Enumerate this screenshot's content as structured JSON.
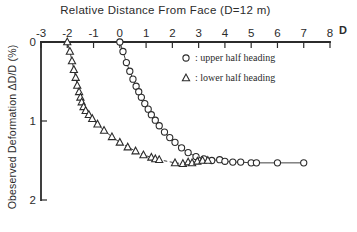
{
  "chart_data": {
    "type": "scatter",
    "title": "Relative Distance From Face (D=12 m)",
    "xlabel": "Relative Distance From Face (D=12 m)",
    "ylabel": "Obeserved Deformation ΔD/D (%)",
    "x_unit_label": "D",
    "xlim": [
      -3,
      8
    ],
    "ylim": [
      0,
      2
    ],
    "y_inverted": true,
    "x_axis_position": "top",
    "y_axis_position": "left",
    "grid": false,
    "xticks": [
      -3,
      -2,
      -1,
      0,
      1,
      2,
      3,
      4,
      5,
      6,
      7,
      8
    ],
    "xtick_labels": [
      "-3",
      "-2",
      "-1",
      "0",
      "1",
      "2",
      "3",
      "4",
      "5",
      "6",
      "7",
      "8"
    ],
    "yticks": [
      0,
      1,
      2
    ],
    "ytick_labels": [
      "0",
      "1",
      "2"
    ],
    "legend_position": "upper right",
    "series": [
      {
        "name": "upper half heading",
        "marker": "circle",
        "legend_label": ": upper half heading",
        "line_style": "solid",
        "points": [
          [
            0.0,
            0.0
          ],
          [
            0.12,
            0.12
          ],
          [
            0.25,
            0.26
          ],
          [
            0.38,
            0.37
          ],
          [
            0.5,
            0.47
          ],
          [
            0.62,
            0.56
          ],
          [
            0.72,
            0.63
          ],
          [
            0.82,
            0.7
          ],
          [
            0.95,
            0.78
          ],
          [
            1.08,
            0.85
          ],
          [
            1.2,
            0.92
          ],
          [
            1.35,
            0.99
          ],
          [
            1.5,
            1.06
          ],
          [
            1.7,
            1.14
          ],
          [
            1.9,
            1.21
          ],
          [
            2.1,
            1.27
          ],
          [
            2.35,
            1.34
          ],
          [
            2.6,
            1.4
          ],
          [
            2.9,
            1.45
          ],
          [
            3.2,
            1.48
          ],
          [
            3.5,
            1.5
          ],
          [
            3.8,
            1.49
          ],
          [
            4.0,
            1.51
          ],
          [
            4.3,
            1.52
          ],
          [
            4.6,
            1.52
          ],
          [
            5.0,
            1.53
          ],
          [
            5.2,
            1.53
          ],
          [
            6.0,
            1.53
          ],
          [
            7.0,
            1.53
          ]
        ]
      },
      {
        "name": "lower half heading",
        "marker": "triangle",
        "legend_label": ": lower half heading",
        "line_style": "solid-then-dashed",
        "dash_from_index": 16,
        "points": [
          [
            -2.0,
            0.0
          ],
          [
            -1.9,
            0.12
          ],
          [
            -1.82,
            0.24
          ],
          [
            -1.75,
            0.35
          ],
          [
            -1.68,
            0.45
          ],
          [
            -1.62,
            0.55
          ],
          [
            -1.55,
            0.63
          ],
          [
            -1.5,
            0.7
          ],
          [
            -1.45,
            0.76
          ],
          [
            -1.38,
            0.82
          ],
          [
            -1.3,
            0.87
          ],
          [
            -1.18,
            0.92
          ],
          [
            -1.05,
            0.97
          ],
          [
            -0.85,
            1.04
          ],
          [
            -0.6,
            1.12
          ],
          [
            -0.3,
            1.2
          ],
          [
            0.0,
            1.27
          ],
          [
            0.3,
            1.33
          ],
          [
            0.6,
            1.38
          ],
          [
            0.9,
            1.43
          ],
          [
            1.2,
            1.46
          ],
          [
            1.35,
            1.48
          ],
          [
            1.5,
            1.49
          ],
          [
            2.1,
            1.53
          ],
          [
            2.4,
            1.54
          ],
          [
            2.6,
            1.52
          ],
          [
            2.75,
            1.53
          ],
          [
            2.95,
            1.51
          ],
          [
            3.15,
            1.5
          ],
          [
            3.35,
            1.5
          ]
        ]
      }
    ]
  }
}
